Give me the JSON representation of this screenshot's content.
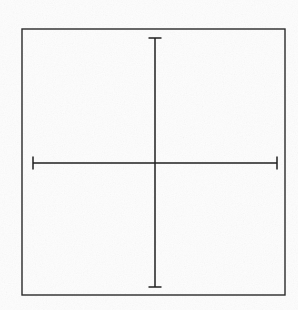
{
  "figure": {
    "kind": "cartesian-graph",
    "background_color": "#fdfdfd",
    "ink_color": "#1a1a1a",
    "frame": {
      "visible": true,
      "x": 22,
      "y": 29,
      "width": 263,
      "height": 266,
      "stroke_color": "#2a2a2a",
      "stroke_width": 1.4
    },
    "axes": {
      "origin_px": {
        "x": 155,
        "y": 163
      },
      "x_axis": {
        "label": "x",
        "label_px": {
          "x": 272,
          "y": 152
        },
        "start_px": 33,
        "end_px": 277,
        "end_caps": true,
        "major_tick_half_len": 5,
        "minor_tick_half_len": 2.5,
        "tick_spacing_px": 12,
        "stroke_width": 1.4
      },
      "y_axis": {
        "label": "y",
        "label_px": {
          "x": 164,
          "y": 41
        },
        "start_px": 38,
        "end_px": 287,
        "end_caps": true,
        "major_tick_half_len": 5,
        "minor_tick_half_len": 2.5,
        "tick_spacing_px": 12,
        "stroke_width": 1.4
      }
    }
  },
  "chart_data": {
    "type": "line",
    "title": "",
    "subtitle": "",
    "xlabel": "x",
    "ylabel": "y",
    "grid": false,
    "legend": null,
    "annotations": [],
    "function": "y = a * b^x  (0 < b < 1)",
    "asymptote": {
      "axis": "x",
      "value": 0
    },
    "y_intercept": 3.5,
    "xlim": [
      -10.2,
      10.2
    ],
    "ylim": [
      -10.4,
      10.4
    ],
    "x_tick_interval": 1,
    "y_tick_interval": 1,
    "x_major_tick_interval": 2,
    "y_major_tick_interval": 2,
    "x": [
      -4.1,
      -3.8,
      -3.5,
      -3.0,
      -2.5,
      -2.0,
      -1.5,
      -1.0,
      -0.5,
      0.0,
      0.5,
      1.0,
      1.5,
      2.0,
      2.5,
      3.0,
      3.5,
      4.0,
      5.0,
      6.0,
      7.0,
      8.0,
      9.0,
      10.0
    ],
    "values": [
      11.2,
      9.9,
      8.7,
      7.0,
      5.9,
      5.0,
      4.5,
      4.1,
      3.8,
      3.5,
      2.9,
      2.4,
      2.0,
      1.65,
      1.35,
      1.1,
      0.9,
      0.72,
      0.5,
      0.35,
      0.25,
      0.18,
      0.12,
      0.08
    ],
    "series": [
      {
        "name": "exponential-decay",
        "stroke_color": "#1f1f1f",
        "stroke_width": 1.5,
        "x": [
          -4.1,
          -3.8,
          -3.5,
          -3.0,
          -2.5,
          -2.0,
          -1.5,
          -1.0,
          -0.5,
          0.0,
          0.5,
          1.0,
          1.5,
          2.0,
          2.5,
          3.0,
          3.5,
          4.0,
          5.0,
          6.0,
          7.0,
          8.0,
          9.0,
          10.0
        ],
        "values": [
          11.2,
          9.9,
          8.7,
          7.0,
          5.9,
          5.0,
          4.5,
          4.1,
          3.8,
          3.5,
          2.9,
          2.4,
          2.0,
          1.65,
          1.35,
          1.1,
          0.9,
          0.72,
          0.5,
          0.35,
          0.25,
          0.18,
          0.12,
          0.08
        ]
      }
    ]
  }
}
